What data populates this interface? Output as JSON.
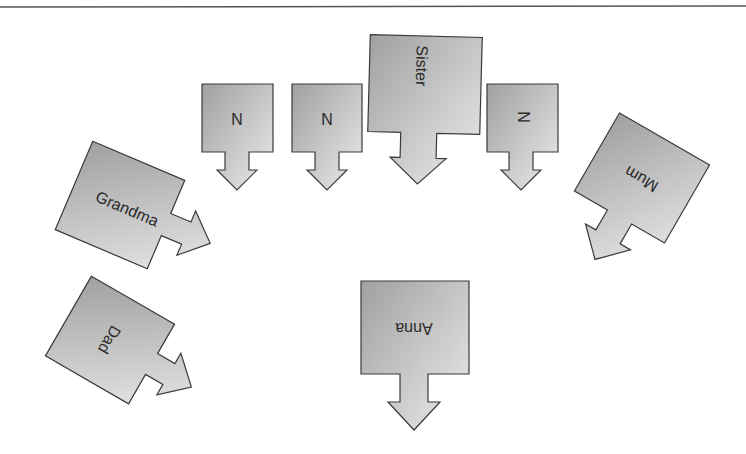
{
  "diagram": {
    "title": "",
    "colors": {
      "shape_light": "#e6e6e6",
      "shape_dark": "#9a9a9a",
      "stroke": "#3a3a3a",
      "text": "#2a2a2a",
      "rule": "#555555"
    },
    "nodes": [
      {
        "id": "n1",
        "label": "N",
        "direction": "down"
      },
      {
        "id": "n2",
        "label": "N",
        "direction": "down"
      },
      {
        "id": "sister",
        "label": "Sister",
        "direction": "down"
      },
      {
        "id": "n3",
        "label": "N",
        "direction": "down"
      },
      {
        "id": "mum",
        "label": "Mum",
        "direction": "down-left"
      },
      {
        "id": "grandma",
        "label": "Grandma",
        "direction": "right"
      },
      {
        "id": "dad",
        "label": "Dad",
        "direction": "right"
      },
      {
        "id": "anna",
        "label": "Anna",
        "direction": "down"
      }
    ]
  }
}
